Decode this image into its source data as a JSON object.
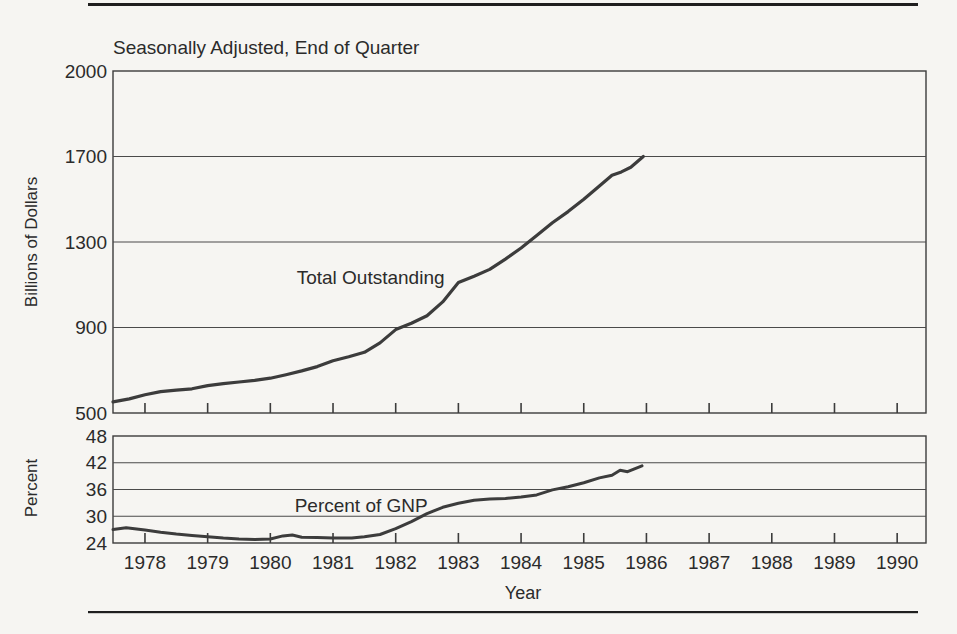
{
  "page": {
    "background": "#f6f5f2",
    "rule_color": "#1f1f1f",
    "ink_color": "#3c3c3c",
    "grid_color": "#4a4a4a",
    "text_color": "#2b2b2b"
  },
  "chart_data": [
    {
      "type": "line",
      "title": "Seasonally Adjusted, End of Quarter",
      "ylabel": "Billions of Dollars",
      "xlabel": "Year",
      "yticks": [
        2000,
        1700,
        1300,
        900,
        500
      ],
      "ylim": [
        500,
        2000
      ],
      "xticks": [
        1978,
        1979,
        1980,
        1981,
        1982,
        1983,
        1984,
        1985,
        1986,
        1987,
        1988,
        1989,
        1990
      ],
      "xlim": [
        1977.49,
        1990.46
      ],
      "grid": "horizontal",
      "legend": "none",
      "annotation": {
        "text": "Total Outstanding",
        "x": 1981.6,
        "y": 1135
      },
      "series": [
        {
          "name": "Total Outstanding",
          "units": "billions of dollars",
          "points": [
            [
              1977.49,
              552
            ],
            [
              1977.75,
              566
            ],
            [
              1978.0,
              585
            ],
            [
              1978.25,
              600
            ],
            [
              1978.5,
              607
            ],
            [
              1978.75,
              613
            ],
            [
              1979.0,
              628
            ],
            [
              1979.25,
              637
            ],
            [
              1979.5,
              645
            ],
            [
              1979.75,
              653
            ],
            [
              1980.0,
              663
            ],
            [
              1980.25,
              679
            ],
            [
              1980.5,
              697
            ],
            [
              1980.75,
              717
            ],
            [
              1981.0,
              744
            ],
            [
              1981.25,
              763
            ],
            [
              1981.5,
              784
            ],
            [
              1981.75,
              828
            ],
            [
              1982.0,
              890
            ],
            [
              1982.25,
              920
            ],
            [
              1982.5,
              955
            ],
            [
              1982.75,
              1020
            ],
            [
              1983.0,
              1110
            ],
            [
              1983.25,
              1140
            ],
            [
              1983.5,
              1172
            ],
            [
              1983.75,
              1220
            ],
            [
              1984.0,
              1272
            ],
            [
              1984.25,
              1330
            ],
            [
              1984.5,
              1390
            ],
            [
              1984.75,
              1442
            ],
            [
              1985.0,
              1500
            ],
            [
              1985.25,
              1562
            ],
            [
              1985.45,
              1612
            ],
            [
              1985.6,
              1628
            ],
            [
              1985.75,
              1650
            ],
            [
              1985.95,
              1700
            ]
          ]
        }
      ]
    },
    {
      "type": "line",
      "title": "",
      "ylabel": "Percent",
      "xlabel": "Year",
      "yticks": [
        48,
        42,
        36,
        30,
        24
      ],
      "ylim": [
        24,
        48
      ],
      "xticks": [
        1978,
        1979,
        1980,
        1981,
        1982,
        1983,
        1984,
        1985,
        1986,
        1987,
        1988,
        1989,
        1990
      ],
      "xlim": [
        1977.49,
        1990.46
      ],
      "grid": "horizontal",
      "legend": "none",
      "annotation": {
        "text": "Percent of GNP",
        "x": 1981.45,
        "y": 32.6
      },
      "series": [
        {
          "name": "Percent of GNP",
          "units": "percent",
          "points": [
            [
              1977.49,
              27.0
            ],
            [
              1977.7,
              27.4
            ],
            [
              1978.0,
              26.9
            ],
            [
              1978.25,
              26.4
            ],
            [
              1978.5,
              26.0
            ],
            [
              1978.75,
              25.7
            ],
            [
              1979.0,
              25.4
            ],
            [
              1979.25,
              25.1
            ],
            [
              1979.5,
              24.9
            ],
            [
              1979.75,
              24.8
            ],
            [
              1980.0,
              24.9
            ],
            [
              1980.2,
              25.6
            ],
            [
              1980.35,
              25.8
            ],
            [
              1980.5,
              25.3
            ],
            [
              1980.75,
              25.2
            ],
            [
              1981.0,
              25.1
            ],
            [
              1981.3,
              25.1
            ],
            [
              1981.5,
              25.4
            ],
            [
              1981.75,
              25.9
            ],
            [
              1982.0,
              27.2
            ],
            [
              1982.25,
              28.8
            ],
            [
              1982.5,
              30.6
            ],
            [
              1982.75,
              32.0
            ],
            [
              1983.0,
              32.9
            ],
            [
              1983.25,
              33.6
            ],
            [
              1983.5,
              33.9
            ],
            [
              1983.75,
              34.0
            ],
            [
              1984.0,
              34.3
            ],
            [
              1984.25,
              34.8
            ],
            [
              1984.5,
              35.9
            ],
            [
              1984.75,
              36.6
            ],
            [
              1985.0,
              37.5
            ],
            [
              1985.25,
              38.6
            ],
            [
              1985.45,
              39.2
            ],
            [
              1985.58,
              40.3
            ],
            [
              1985.7,
              40.0
            ],
            [
              1985.93,
              41.3
            ]
          ]
        }
      ]
    }
  ]
}
